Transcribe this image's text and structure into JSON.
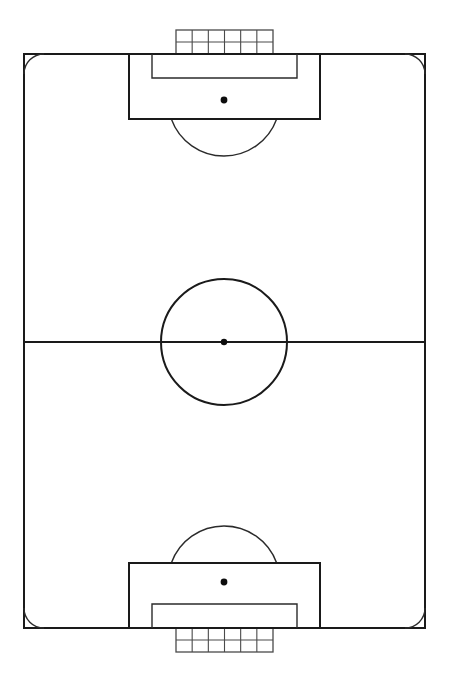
{
  "diagram": {
    "orientation": "vertical",
    "view": "plan-overhead",
    "colors": {
      "background": "#ffffff",
      "line": "#1a1a1a",
      "line_secondary": "#2b2b2b",
      "net": "#4a4a4a",
      "spot": "#0d0d0d"
    },
    "canvas": {
      "width": 452,
      "height": 680
    }
  },
  "geometry": {
    "field": {
      "x": 24,
      "y": 54,
      "width": 401,
      "height": 574
    },
    "halfway_line": {
      "x1": 24,
      "y1": 342,
      "x2": 425,
      "y2": 342
    },
    "center_circle": {
      "cx": 224,
      "cy": 342,
      "r": 63
    },
    "center_spot": {
      "cx": 224,
      "cy": 342,
      "r": 3.2
    },
    "corner_arc_radius": 20,
    "corners": [
      {
        "name": "top-left",
        "cx": 24,
        "cy": 54
      },
      {
        "name": "top-right",
        "cx": 425,
        "cy": 54
      },
      {
        "name": "bottom-left",
        "cx": 24,
        "cy": 628
      },
      {
        "name": "bottom-right",
        "cx": 425,
        "cy": 628
      }
    ],
    "top_end": {
      "penalty_area": {
        "x": 129,
        "y": 54,
        "width": 191,
        "height": 65
      },
      "goal_area": {
        "x": 152,
        "y": 54,
        "width": 145,
        "height": 24
      },
      "penalty_spot": {
        "cx": 224,
        "cy": 100,
        "r": 3.4
      },
      "arc": {
        "cx": 224,
        "cy": 100,
        "r": 56,
        "from_deg": 19,
        "to_deg": 161
      },
      "goal_net": {
        "x": 176,
        "y": 30,
        "width": 97,
        "height": 24,
        "columns": 6,
        "rows": 2
      }
    },
    "bottom_end": {
      "penalty_area": {
        "x": 129,
        "y": 563,
        "width": 191,
        "height": 65
      },
      "goal_area": {
        "x": 152,
        "y": 604,
        "width": 145,
        "height": 24
      },
      "penalty_spot": {
        "cx": 224,
        "cy": 582,
        "r": 3.4
      },
      "arc": {
        "cx": 224,
        "cy": 582,
        "r": 56,
        "from_deg": 199,
        "to_deg": 341
      },
      "goal_net": {
        "x": 176,
        "y": 628,
        "width": 97,
        "height": 24,
        "columns": 6,
        "rows": 2
      }
    }
  },
  "elements": {
    "field_boundary_label": "Touchlines and goal lines",
    "halfway_label": "Halfway line",
    "center_circle_label": "Centre circle",
    "center_spot_label": "Centre mark",
    "penalty_area_label": "Penalty area",
    "goal_area_label": "Goal area",
    "penalty_spot_label": "Penalty mark",
    "penalty_arc_label": "Penalty arc",
    "corner_arc_label": "Corner arc",
    "goal_net_label": "Goal with net"
  }
}
